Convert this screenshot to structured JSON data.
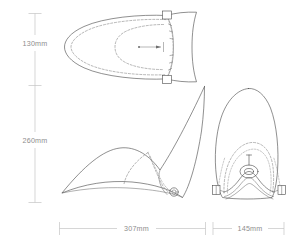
{
  "drawing": {
    "title": "Product technical dimension drawing",
    "background_color": "#ffffff",
    "line_color": "#4a4a4a",
    "hidden_line_color": "#7b7b7b",
    "dimension_line_color": "#c4c4c4",
    "label_color": "#8d8d8d"
  },
  "dimensions": {
    "height_upper": {
      "value": "130mm",
      "orientation": "vertical",
      "position": "left"
    },
    "height_lower": {
      "value": "260mm",
      "orientation": "vertical",
      "position": "left"
    },
    "width_main": {
      "value": "307mm",
      "orientation": "horizontal",
      "position": "bottom-left"
    },
    "width_front": {
      "value": "145mm",
      "orientation": "horizontal",
      "position": "bottom-right"
    }
  },
  "views": {
    "top": {
      "name": "top-view",
      "label": ""
    },
    "side": {
      "name": "side-view",
      "label": ""
    },
    "front": {
      "name": "front-view",
      "label": ""
    }
  }
}
